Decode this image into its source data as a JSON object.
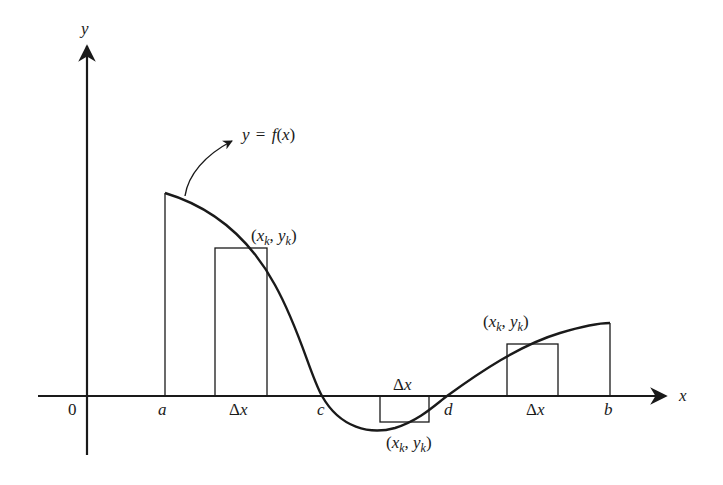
{
  "diagram": {
    "axes": {
      "x_label": "x",
      "y_label": "y",
      "origin_label": "0"
    },
    "curve_label": "y = f(x)",
    "curve_label_parts": {
      "lhs": "y",
      "eq": "=",
      "f": "f",
      "open": "(",
      "var": "x",
      "close": ")"
    },
    "x_ticks": [
      {
        "label": "a",
        "italic": true
      },
      {
        "label": "Δx",
        "italic": false
      },
      {
        "label": "c",
        "italic": true
      },
      {
        "label": "Δx",
        "italic": false
      },
      {
        "label": "d",
        "italic": true
      },
      {
        "label": "Δx",
        "italic": false
      },
      {
        "label": "b",
        "italic": true
      }
    ],
    "sample_point_labels": [
      {
        "text": "(x_k, y_k)",
        "position": "above first rectangle"
      },
      {
        "text": "(x_k, y_k)",
        "position": "below negative rectangle"
      },
      {
        "text": "(x_k, y_k)",
        "position": "above right rectangle"
      }
    ],
    "rectangles": [
      {
        "name": "positive-rectangle-left",
        "sign": "positive"
      },
      {
        "name": "negative-rectangle-middle",
        "sign": "negative"
      },
      {
        "name": "positive-rectangle-right",
        "sign": "positive"
      }
    ],
    "colors": {
      "stroke": "#1a1a1a",
      "background": "#ffffff"
    }
  }
}
